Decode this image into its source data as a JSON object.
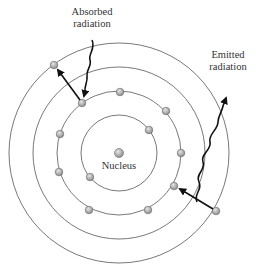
{
  "diagram": {
    "labels": {
      "absorbed_line1": "Absorbed",
      "absorbed_line2": "radiation",
      "emitted_line1": "Emitted",
      "emitted_line2": "radiation",
      "nucleus": "Nucleus"
    },
    "colors": {
      "orbit": "#555555",
      "electron_fill": "#a8a8a8",
      "electron_stroke": "#6a6a6a",
      "arrow": "#111111",
      "text": "#333333"
    }
  }
}
